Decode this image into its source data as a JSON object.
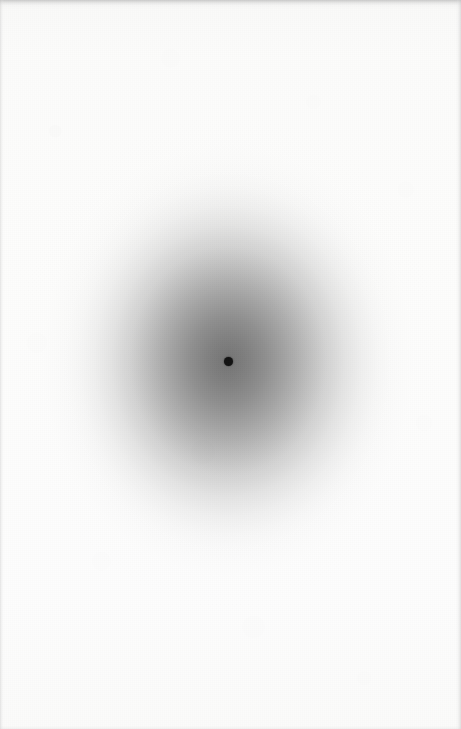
{
  "page": {
    "kind": "scanned-plate",
    "width": 461,
    "height": 729,
    "paper_color": "#fbfbfa",
    "caption": "",
    "title": ""
  },
  "figure": {
    "name": "radial-gray-blob-with-fixation-dot",
    "label": ""
  },
  "chart_data": {
    "type": "heatmap",
    "title": "",
    "subtitle": "",
    "xlabel": "",
    "ylabel": "",
    "legend": [],
    "grid": false,
    "annotations": [],
    "center": {
      "x": 228,
      "y": 361
    },
    "radius_x": 172,
    "radius_y": 200,
    "colormap": "grayscale",
    "value_label": "intensity",
    "background_value": 255,
    "peak_value": 110,
    "radial_profile": {
      "r_fraction": [
        0.0,
        0.1,
        0.22,
        0.34,
        0.46,
        0.57,
        0.68,
        0.78,
        0.87,
        0.94,
        1.0
      ],
      "gray_level": [
        110,
        116,
        126,
        140,
        158,
        178,
        198,
        216,
        232,
        245,
        255
      ]
    },
    "markers": [
      {
        "name": "fixation-dot",
        "x": 228,
        "y": 361,
        "diameter": 9,
        "color": "#121212",
        "label": ""
      }
    ]
  },
  "artifacts": {
    "top_edge": "scan-edge-shadow",
    "left_edge": "scan-edge-shadow",
    "right_edge": "scan-edge-shadow",
    "bottom_edge": "scan-edge-shadow",
    "texture": "paper-grain"
  },
  "colors": {
    "paper": "#fbfbfa",
    "blob_center": "#6e6e6e",
    "blob_mid": "#9e9e9e",
    "blob_outer": "#ededed",
    "dot": "#121212",
    "edge_shadow": "#c4c4c4"
  }
}
